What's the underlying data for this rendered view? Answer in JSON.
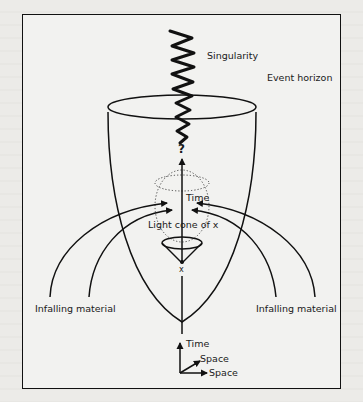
{
  "diagram": {
    "type": "black-hole-formation-spacetime",
    "labels": {
      "singularity": "Singularity",
      "event_horizon": "Event horizon",
      "question": "?",
      "time_upper": "Time",
      "light_cone": "Light cone of x",
      "point_x": "x",
      "infalling_left": "Infalling material",
      "infalling_right": "Infalling material",
      "axis_time": "Time",
      "axis_space_diag": "Space",
      "axis_space_horiz": "Space"
    },
    "colors": {
      "ink": "#111111",
      "paper": "#f2f2f0"
    }
  }
}
